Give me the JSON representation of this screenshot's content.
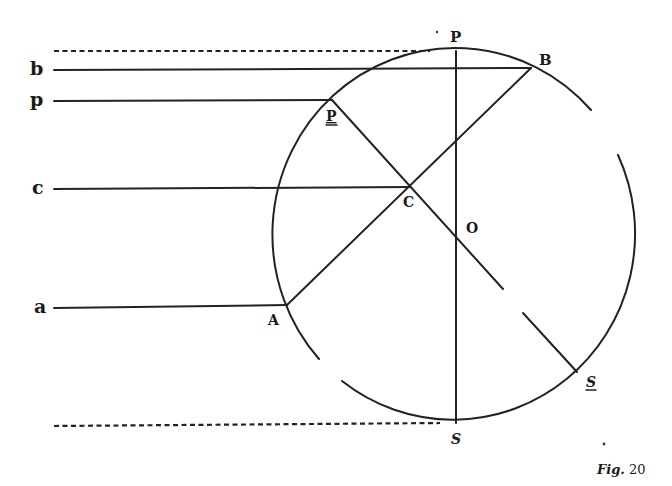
{
  "figure": {
    "caption_prefix": "Fig.",
    "caption_number": "20"
  },
  "labels": {
    "left": {
      "b": "b",
      "p": "p",
      "c": "c",
      "a": "a"
    },
    "points": {
      "P_top": "P",
      "B": "B",
      "P_underlined": "P",
      "C": "C",
      "O": "O",
      "A": "A",
      "S_underlined": "S",
      "S_bottom": "S"
    }
  },
  "geometry": {
    "circle_center": [
      456,
      237
    ],
    "radius_x": 182,
    "radius_y": 186,
    "P_top": [
      456,
      51
    ],
    "S_bottom": [
      456,
      423
    ],
    "B": [
      531,
      68
    ],
    "A": [
      287,
      305
    ],
    "P_underlined": [
      332,
      100
    ],
    "S_underlined": [
      577,
      372
    ],
    "C": [
      410,
      187
    ],
    "O": [
      456,
      226
    ]
  }
}
